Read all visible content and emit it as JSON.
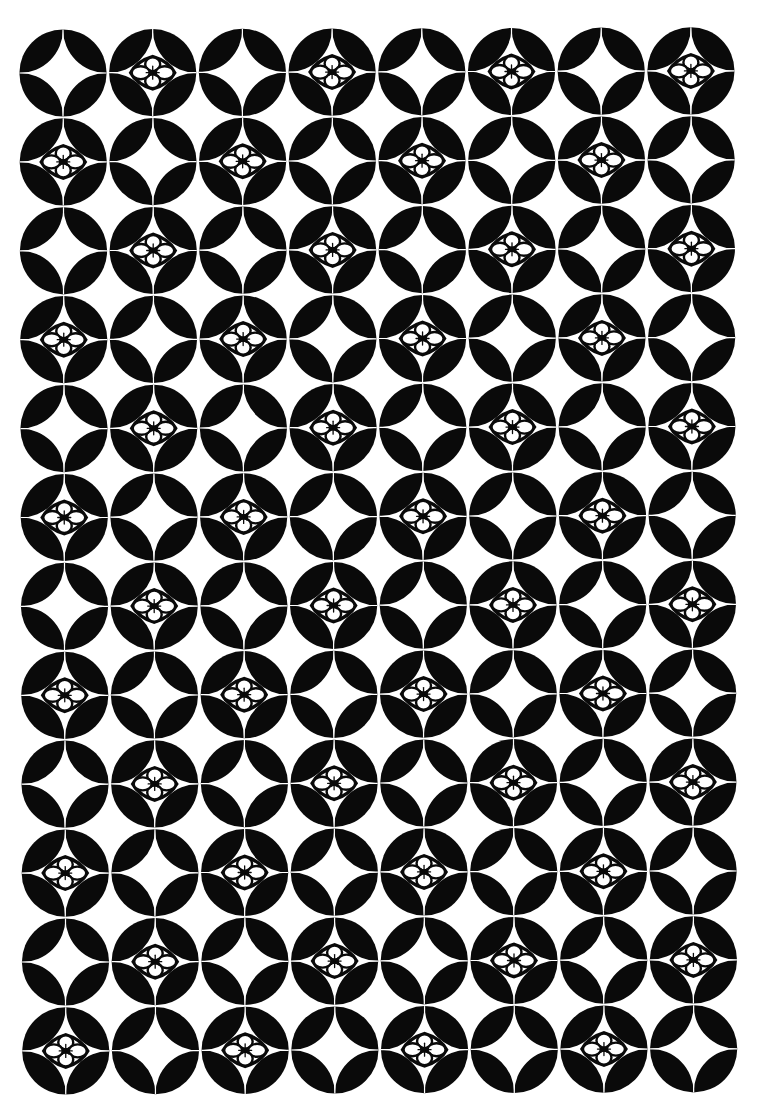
{
  "image": {
    "title": "Shippo interlocking circles pattern with flower crests",
    "width": 763,
    "height": 1111
  },
  "colors": {
    "background": "#ffffff",
    "ink": "#0a0a0a"
  },
  "grid": {
    "columns": 8,
    "rows": 12,
    "origin_x": 63,
    "origin_y": 73,
    "pitch_x": 89.7,
    "pitch_y": 88.9,
    "drift_x_per_row": 0.25,
    "drift_y_per_col": -0.3,
    "radius": 43.6
  },
  "motifs": {
    "plain": "shippo-circle",
    "flower": "hanabishi-flower-crest",
    "flower_rule": "cells where (row + column) is odd contain a flower"
  },
  "flower": {
    "width": 48,
    "height": 36
  }
}
